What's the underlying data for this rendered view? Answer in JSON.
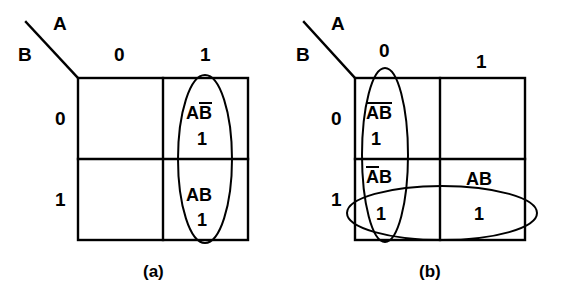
{
  "figure": {
    "title_axis_a": "A",
    "title_axis_b": "B",
    "maps": [
      {
        "id": "a",
        "caption": "(a)",
        "axis_label_top": "A",
        "axis_label_left": "B",
        "column_headers": [
          "0",
          "1"
        ],
        "row_headers": [
          "0",
          "1"
        ],
        "cells": [
          {
            "row": 0,
            "col": 0,
            "term": "",
            "term_bars": [],
            "value": ""
          },
          {
            "row": 0,
            "col": 1,
            "term": "AB",
            "term_parts": [
              {
                "text": "A",
                "bar": false
              },
              {
                "text": "B",
                "bar": true
              }
            ],
            "value": "1"
          },
          {
            "row": 1,
            "col": 0,
            "term": "",
            "term_bars": [],
            "value": ""
          },
          {
            "row": 1,
            "col": 1,
            "term": "AB",
            "term_parts": [
              {
                "text": "A",
                "bar": false
              },
              {
                "text": "B",
                "bar": false
              }
            ],
            "value": "1"
          }
        ],
        "groupings": [
          {
            "name": "vertical-group-column-1",
            "orientation": "vertical",
            "covers": [
              "A B-bar = 1",
              "A B = 1"
            ]
          }
        ]
      },
      {
        "id": "b",
        "caption": "(b)",
        "axis_label_top": "A",
        "axis_label_left": "B",
        "column_headers": [
          "0",
          "1"
        ],
        "row_headers": [
          "0",
          "1"
        ],
        "cells": [
          {
            "row": 0,
            "col": 0,
            "term": "AB",
            "term_parts": [
              {
                "text": "A",
                "bar": true
              },
              {
                "text": "B",
                "bar": true
              }
            ],
            "value": "1"
          },
          {
            "row": 0,
            "col": 1,
            "term": "",
            "term_parts": [],
            "value": ""
          },
          {
            "row": 1,
            "col": 0,
            "term": "AB",
            "term_parts": [
              {
                "text": "A",
                "bar": true
              },
              {
                "text": "B",
                "bar": false
              }
            ],
            "value": "1"
          },
          {
            "row": 1,
            "col": 1,
            "term": "AB",
            "term_parts": [
              {
                "text": "A",
                "bar": false
              },
              {
                "text": "B",
                "bar": false
              }
            ],
            "value": "1"
          }
        ],
        "groupings": [
          {
            "name": "vertical-group-column-0",
            "orientation": "vertical",
            "covers": [
              "A-bar B-bar = 1",
              "A-bar B = 1"
            ]
          },
          {
            "name": "horizontal-group-row-1",
            "orientation": "horizontal",
            "covers": [
              "A-bar B = 1",
              "A B = 1"
            ]
          }
        ]
      }
    ]
  },
  "style": {
    "ink": "#000000",
    "background": "#ffffff"
  }
}
